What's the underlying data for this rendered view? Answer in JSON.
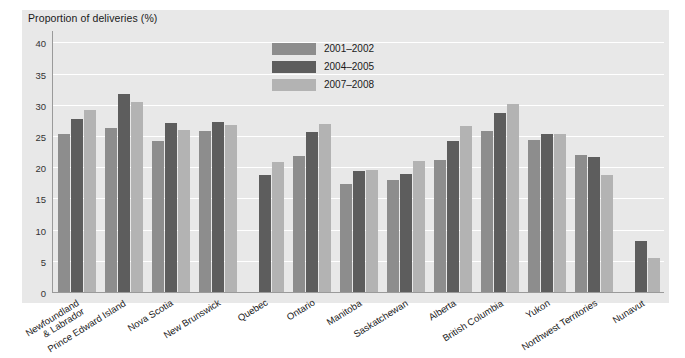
{
  "chart_data": {
    "type": "bar",
    "title": "Proportion of deliveries (%)",
    "xlabel": "",
    "ylabel": "Proportion of deliveries (%)",
    "ylim": [
      0,
      42
    ],
    "yticks": [
      0,
      5,
      10,
      15,
      20,
      25,
      30,
      35,
      40
    ],
    "grid": true,
    "legend_position": "top-center",
    "categories": [
      "Newfoundland & Labrador",
      "Prince Edward Island",
      "Nova Scotia",
      "New Brunswick",
      "Quebec",
      "Ontario",
      "Manitoba",
      "Saskatchewan",
      "Alberta",
      "British Columbia",
      "Yukon",
      "Northwest Territories",
      "Nunavut"
    ],
    "categories_multiline": [
      [
        "Newfoundland",
        "& Labrador"
      ],
      [
        "Prince Edward Island"
      ],
      [
        "Nova Scotia"
      ],
      [
        "New Brunswick"
      ],
      [
        "Quebec"
      ],
      [
        "Ontario"
      ],
      [
        "Manitoba"
      ],
      [
        "Saskatchewan"
      ],
      [
        "Alberta"
      ],
      [
        "British Columbia"
      ],
      [
        "Yukon"
      ],
      [
        "Northwest Territories"
      ],
      [
        "Nunavut"
      ]
    ],
    "series": [
      {
        "name": "2001–2002",
        "color": "#8d8d8d",
        "values": [
          25.4,
          26.3,
          24.2,
          25.8,
          null,
          21.8,
          17.3,
          17.9,
          21.2,
          25.8,
          24.3,
          22.0,
          null
        ]
      },
      {
        "name": "2004–2005",
        "color": "#5d5d5d",
        "values": [
          27.8,
          31.7,
          27.1,
          27.2,
          18.7,
          25.7,
          19.4,
          18.9,
          24.2,
          28.7,
          25.3,
          21.7,
          8.2
        ]
      },
      {
        "name": "2007–2008",
        "color": "#b3b3b3",
        "values": [
          29.2,
          30.4,
          25.9,
          26.8,
          20.9,
          26.9,
          19.5,
          21.0,
          26.6,
          30.1,
          25.4,
          18.8,
          5.4
        ]
      }
    ],
    "colors": {
      "panel": "#e8e8e8",
      "gridline": "#ffffff",
      "axis": "#9a9a9a",
      "series1": "#8d8d8d",
      "series2": "#5d5d5d",
      "series3": "#b3b3b3"
    }
  }
}
